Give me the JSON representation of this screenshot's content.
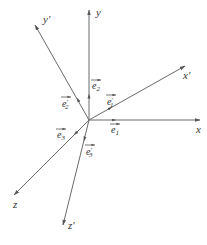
{
  "figure": {
    "origin": {
      "x": 89,
      "y": 120
    },
    "axes": [
      {
        "id": "x",
        "label": "x",
        "end": {
          "x": 200,
          "y": 120
        },
        "label_pos": {
          "x": 196,
          "y": 133
        }
      },
      {
        "id": "y",
        "label": "y",
        "end": {
          "x": 89,
          "y": 10
        },
        "label_pos": {
          "x": 96,
          "y": 16
        }
      },
      {
        "id": "z",
        "label": "z",
        "end": {
          "x": 14,
          "y": 195
        },
        "label_pos": {
          "x": 13,
          "y": 208
        }
      },
      {
        "id": "x'",
        "label": "x'",
        "end": {
          "x": 185,
          "y": 66
        },
        "label_pos": {
          "x": 183,
          "y": 79
        }
      },
      {
        "id": "y'",
        "label": "y'",
        "end": {
          "x": 35,
          "y": 25
        },
        "label_pos": {
          "x": 43,
          "y": 23
        }
      },
      {
        "id": "z'",
        "label": "z'",
        "end": {
          "x": 63,
          "y": 225
        },
        "label_pos": {
          "x": 68,
          "y": 229
        }
      }
    ],
    "vectors": [
      {
        "id": "e1",
        "label": "e",
        "sub": "1",
        "prime": false,
        "label_pos": {
          "x": 111,
          "y": 133
        }
      },
      {
        "id": "e2",
        "label": "e",
        "sub": "2",
        "prime": false,
        "label_pos": {
          "x": 92,
          "y": 89
        }
      },
      {
        "id": "e3",
        "label": "e",
        "sub": "3",
        "prime": false,
        "label_pos": {
          "x": 57,
          "y": 138
        }
      },
      {
        "id": "e1p",
        "label": "e",
        "sub": "1",
        "prime": true,
        "label_pos": {
          "x": 107,
          "y": 105
        }
      },
      {
        "id": "e2p",
        "label": "e",
        "sub": "2",
        "prime": true,
        "label_pos": {
          "x": 62,
          "y": 107
        }
      },
      {
        "id": "e3p",
        "label": "e",
        "sub": "3",
        "prime": true,
        "label_pos": {
          "x": 86,
          "y": 155
        }
      }
    ],
    "stroke_color": "#6a6a6a",
    "text_color": "#333333"
  }
}
